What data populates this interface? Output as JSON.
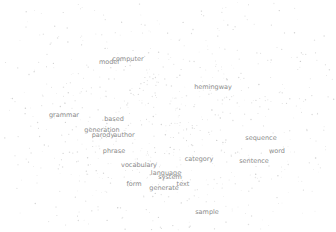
{
  "chart_data": {
    "type": "scatter",
    "title": "",
    "xlabel": "",
    "ylabel": "",
    "grid": false,
    "legend": null,
    "labeled_points": [
      {
        "label": "model",
        "x": 109,
        "y": 62
      },
      {
        "label": "computer",
        "x": 128,
        "y": 59
      },
      {
        "label": "hemingway",
        "x": 213,
        "y": 87
      },
      {
        "label": "grammar",
        "x": 64,
        "y": 115
      },
      {
        "label": "based",
        "x": 114,
        "y": 119
      },
      {
        "label": "generation",
        "x": 102,
        "y": 130
      },
      {
        "label": "parody",
        "x": 103,
        "y": 135
      },
      {
        "label": "author",
        "x": 124,
        "y": 135
      },
      {
        "label": "phrase",
        "x": 114,
        "y": 151
      },
      {
        "label": "vocabulary",
        "x": 139,
        "y": 165
      },
      {
        "label": "category",
        "x": 199,
        "y": 159
      },
      {
        "label": "sequence",
        "x": 261,
        "y": 138
      },
      {
        "label": "word",
        "x": 277,
        "y": 151
      },
      {
        "label": "sentence",
        "x": 254,
        "y": 161
      },
      {
        "label": "language",
        "x": 166,
        "y": 173
      },
      {
        "label": "system",
        "x": 170,
        "y": 177
      },
      {
        "label": "text",
        "x": 183,
        "y": 184
      },
      {
        "label": "form",
        "x": 134,
        "y": 184
      },
      {
        "label": "generate",
        "x": 164,
        "y": 188
      },
      {
        "label": "sample",
        "x": 207,
        "y": 212
      }
    ],
    "point_color": "#c8c8c8",
    "label_color": "#8a8a8a"
  }
}
